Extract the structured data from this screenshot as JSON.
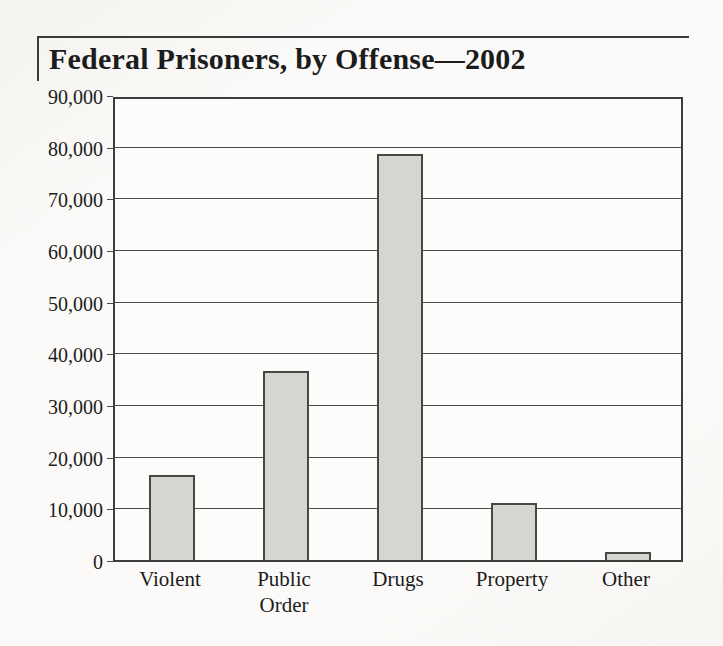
{
  "header": {
    "title": "Federal Prisoners, by Offense—2002"
  },
  "chart_data": {
    "type": "bar",
    "title": "Federal Prisoners, by Offense—2002",
    "categories": [
      "Violent",
      "Public Order",
      "Drugs",
      "Property",
      "Other"
    ],
    "category_label_lines": [
      [
        "Violent"
      ],
      [
        "Public",
        "Order"
      ],
      [
        "Drugs"
      ],
      [
        "Property"
      ],
      [
        "Other"
      ]
    ],
    "values": [
      16500,
      36500,
      78500,
      11000,
      1500
    ],
    "xlabel": "",
    "ylabel": "",
    "ylim": [
      0,
      90000
    ],
    "ytick_interval": 10000,
    "ytick_labels": [
      "0",
      "10,000",
      "20,000",
      "30,000",
      "40,000",
      "50,000",
      "60,000",
      "70,000",
      "80,000",
      "90,000"
    ],
    "grid": true,
    "legend": false,
    "bar_fill_color": "#d6d5d2",
    "bar_border_color": "#474745",
    "line_color": "#3d3d3b",
    "background_color": "#fbfaf8"
  }
}
